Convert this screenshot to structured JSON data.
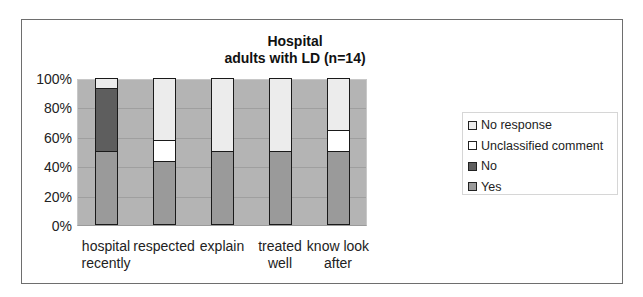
{
  "chart_data": {
    "type": "bar",
    "stacked": true,
    "percent_stacked": true,
    "title": "Hospital adults with LD (n=14)",
    "title_lines": [
      "Hospital",
      "adults with LD (n=14)"
    ],
    "xlabel": "",
    "ylabel": "",
    "ylim": [
      0,
      100
    ],
    "yticks": [
      "0%",
      "20%",
      "40%",
      "60%",
      "80%",
      "100%"
    ],
    "grid": true,
    "legend_position": "right",
    "categories": [
      "hospital recently",
      "respected",
      "explain",
      "treated well",
      "know look after"
    ],
    "category_lines": [
      [
        "hospital",
        "recently"
      ],
      [
        "respected"
      ],
      [
        "explain"
      ],
      [
        "treated",
        "well"
      ],
      [
        "know look",
        "after"
      ]
    ],
    "series": [
      {
        "name": "Yes",
        "color": "#9a9a9a",
        "values": [
          50,
          43,
          50,
          50,
          50
        ]
      },
      {
        "name": "No",
        "color": "#5e5e5e",
        "values": [
          43,
          0,
          0,
          0,
          0
        ]
      },
      {
        "name": "Unclassified comment",
        "color": "#ffffff",
        "values": [
          0,
          14,
          0,
          0,
          14
        ]
      },
      {
        "name": "No response",
        "color": "#ececec",
        "values": [
          7,
          43,
          50,
          50,
          36
        ]
      }
    ],
    "legend_order": [
      "No response",
      "Unclassified comment",
      "No",
      "Yes"
    ],
    "plot_background": "#b4b4b4"
  }
}
